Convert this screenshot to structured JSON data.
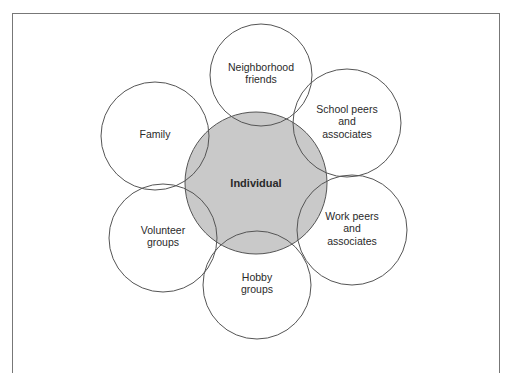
{
  "diagram": {
    "type": "overlapping-circles",
    "colors": {
      "center_fill": "#c9c9c9",
      "outer_fill": "#ffffff",
      "stroke": "#555555",
      "frame": "#777777"
    },
    "center": {
      "label": "Individual",
      "cx": 256,
      "cy": 183,
      "r": 71
    },
    "nodes": [
      {
        "id": "neighborhood",
        "lines": [
          "Neighborhood",
          "friends"
        ],
        "cx": 261,
        "cy": 75,
        "r": 51
      },
      {
        "id": "school",
        "lines": [
          "School peers",
          "and",
          "associates"
        ],
        "cx": 347,
        "cy": 123,
        "r": 54
      },
      {
        "id": "work",
        "lines": [
          "Work peers",
          "and",
          "associates"
        ],
        "cx": 352,
        "cy": 230,
        "r": 55
      },
      {
        "id": "hobby",
        "lines": [
          "Hobby",
          "groups"
        ],
        "cx": 257,
        "cy": 285,
        "r": 54
      },
      {
        "id": "volunteer",
        "lines": [
          "Volunteer",
          "groups"
        ],
        "cx": 163,
        "cy": 238,
        "r": 54
      },
      {
        "id": "family",
        "lines": [
          "Family"
        ],
        "cx": 155,
        "cy": 136,
        "r": 54
      }
    ]
  }
}
